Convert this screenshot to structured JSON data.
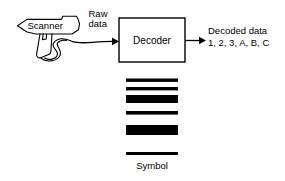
{
  "diagram": {
    "background_color": "#ffffff",
    "line_color": "#000000",
    "labels": {
      "scanner": "Scanner",
      "raw_data_line1": "Raw",
      "raw_data_line2": "data",
      "decoder": "Decoder",
      "decoded_line1": "Decoded data",
      "decoded_line2": "1, 2, 3, A, B, C",
      "symbol": "Symbol"
    },
    "nodes": {
      "scanner": {
        "name": "Scanner",
        "shape": "handheld-scanner-gun",
        "x": 16,
        "y": 17,
        "width": 78,
        "height": 58
      },
      "decoder": {
        "name": "Decoder",
        "shape": "rectangle",
        "x": 119,
        "y": 18,
        "width": 66,
        "height": 44
      },
      "symbol": {
        "name": "Symbol",
        "shape": "barcode",
        "x": 126,
        "y": 77,
        "width": 52,
        "height": 78
      }
    },
    "edges": [
      {
        "name": "raw-data-flow",
        "from": "scanner",
        "to": "decoder",
        "label": "Raw data",
        "style": "curved-cable-with-arrow"
      },
      {
        "name": "decoded-data-flow",
        "from": "decoder",
        "to": "decoded-data-text",
        "label": "Decoded data",
        "style": "straight-arrow"
      }
    ],
    "barcode": {
      "left": 126,
      "right": 178,
      "bars": [
        {
          "y": 78.5,
          "height": 3.4
        },
        {
          "y": 87.0,
          "height": 3.4
        },
        {
          "y": 95.0,
          "height": 8.0
        },
        {
          "y": 111.0,
          "height": 3.6
        },
        {
          "y": 125.0,
          "height": 10.0
        },
        {
          "y": 152.0,
          "height": 3.0
        }
      ]
    }
  }
}
